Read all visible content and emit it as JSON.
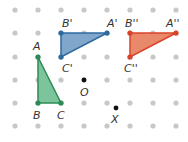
{
  "grid": {
    "cols_x": [
      15,
      38,
      61,
      84,
      107,
      130,
      153,
      176
    ],
    "rows_y": [
      10,
      33,
      57,
      80,
      103,
      126
    ],
    "dot_color": "#c8c8c8",
    "dot_radius": 2.6
  },
  "shapes": [
    {
      "name": "triangle-ABC",
      "fill": "#7cc49b",
      "stroke": "#2d8a55",
      "vertices": [
        {
          "label": "A",
          "x": 38,
          "y": 57,
          "lx": 33,
          "ly": 50
        },
        {
          "label": "B",
          "x": 38,
          "y": 103,
          "lx": 33,
          "ly": 119
        },
        {
          "label": "C",
          "x": 61,
          "y": 103,
          "lx": 57,
          "ly": 119
        }
      ]
    },
    {
      "name": "triangle-A'B'C'",
      "fill": "#80a7cb",
      "stroke": "#2e6aa0",
      "vertices": [
        {
          "label": "A'",
          "x": 107,
          "y": 33,
          "lx": 108,
          "ly": 26
        },
        {
          "label": "B'",
          "x": 61,
          "y": 33,
          "lx": 62,
          "ly": 26
        },
        {
          "label": "C'",
          "x": 61,
          "y": 57,
          "lx": 62,
          "ly": 72
        }
      ]
    },
    {
      "name": "triangle-A''B''C''",
      "fill": "#e9896b",
      "stroke": "#d9432a",
      "vertices": [
        {
          "label": "A''",
          "x": 176,
          "y": 33,
          "lx": 167,
          "ly": 26
        },
        {
          "label": "B''",
          "x": 130,
          "y": 33,
          "lx": 126,
          "ly": 26
        },
        {
          "label": "C''",
          "x": 130,
          "y": 57,
          "lx": 125,
          "ly": 72
        }
      ]
    }
  ],
  "points": [
    {
      "label": "O",
      "x": 84,
      "y": 80,
      "lx": 80,
      "ly": 96
    },
    {
      "label": "X",
      "x": 116,
      "y": 108,
      "lx": 111,
      "ly": 123
    }
  ],
  "labels": {
    "A": "A",
    "B": "B",
    "C": "C",
    "A1": "A'",
    "B1": "B'",
    "C1": "C'",
    "A2": "A''",
    "B2": "B''",
    "C2": "C''",
    "O": "O",
    "X": "X"
  }
}
